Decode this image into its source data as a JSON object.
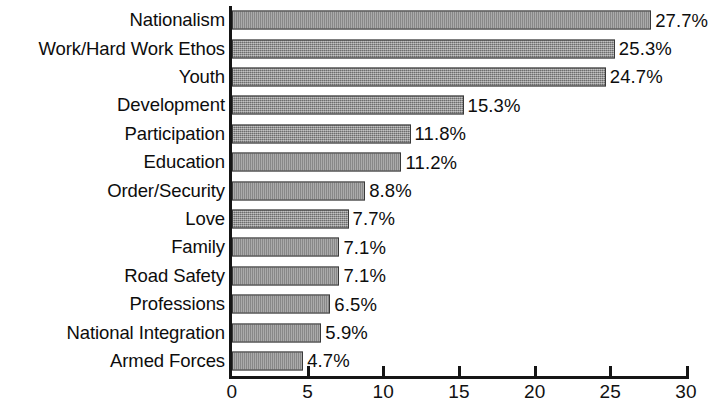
{
  "chart_data": {
    "type": "bar",
    "orientation": "horizontal",
    "title": "",
    "subtitle": "",
    "xlabel": "",
    "ylabel": "",
    "xlim": [
      0,
      30
    ],
    "xticks": [
      "0",
      "5",
      "10",
      "15",
      "20",
      "25",
      "30"
    ],
    "grid": false,
    "legend": false,
    "bar_color": "#8a8a8a",
    "bar_edge_color": "#3a3a3a",
    "axis_color": "#151515",
    "background_color": "#ffffff",
    "value_label_suffix": "%",
    "categories": [
      "Nationalism",
      "Work/Hard Work Ethos",
      "Youth",
      "Development",
      "Participation",
      "Education",
      "Order/Security",
      "Love",
      "Family",
      "Road Safety",
      "Professions",
      "National Integration",
      "Armed Forces"
    ],
    "values": [
      27.7,
      25.3,
      24.7,
      15.3,
      11.8,
      11.2,
      8.8,
      7.7,
      7.1,
      7.1,
      6.5,
      5.9,
      4.7
    ],
    "value_labels": [
      "27.7%",
      "25.3%",
      "24.7%",
      "15.3%",
      "11.8%",
      "11.2%",
      "8.8%",
      "7.7%",
      "7.1%",
      "7.1%",
      "6.5%",
      "5.9%",
      "4.7%"
    ]
  }
}
